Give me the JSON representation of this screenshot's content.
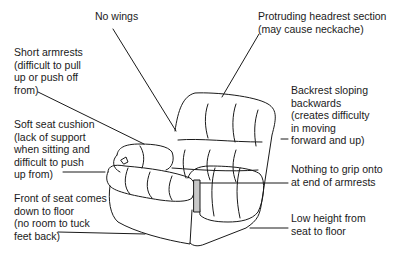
{
  "diagram": {
    "labels": [
      {
        "id": "no-wings",
        "text": "No wings",
        "x": 95,
        "y": 16
      },
      {
        "id": "headrest",
        "text": "Protruding headrest section\n(may cause neckache)",
        "x": 258,
        "y": 16
      },
      {
        "id": "short-armrests",
        "text": "Short armrests\n(difficult to pull\nup or push off\nfrom)",
        "x": 14,
        "y": 52
      },
      {
        "id": "backrest",
        "text": "Backrest sloping\nbackwards\n(creates difficulty\nin moving\nforward and up)",
        "x": 291,
        "y": 90
      },
      {
        "id": "soft-seat",
        "text": "Soft seat cushion\n(lack of support\nwhen sitting and\ndifficult to push\nup from)",
        "x": 14,
        "y": 123
      },
      {
        "id": "nothing-to-grip",
        "text": "Nothing to grip onto\nat end of armrests",
        "x": 291,
        "y": 168
      },
      {
        "id": "front-of-seat",
        "text": "Front of seat comes\ndown to floor\n(no room to tuck\nfeet back)",
        "x": 14,
        "y": 193
      },
      {
        "id": "low-height",
        "text": "Low height from\nseat to floor",
        "x": 291,
        "y": 202
      }
    ]
  }
}
